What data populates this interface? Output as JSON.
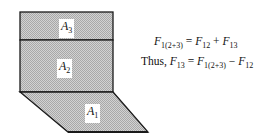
{
  "diagram": {
    "surfaces": [
      {
        "id": "A3",
        "symbol": "A",
        "subscript": "3"
      },
      {
        "id": "A2",
        "symbol": "A",
        "subscript": "2"
      },
      {
        "id": "A1",
        "symbol": "A",
        "subscript": "1"
      }
    ],
    "equations": [
      {
        "prefix": "",
        "lhs": {
          "sym": "F",
          "sub": "1(2+3)"
        },
        "op1": "=",
        "t1": {
          "sym": "F",
          "sub": "12"
        },
        "op2": "+",
        "t2": {
          "sym": "F",
          "sub": "13"
        }
      },
      {
        "prefix": "Thus,",
        "lhs": {
          "sym": "F",
          "sub": "13"
        },
        "op1": "=",
        "t1": {
          "sym": "F",
          "sub": "1(2+3)"
        },
        "op2": "−",
        "t2": {
          "sym": "F",
          "sub": "12"
        }
      }
    ],
    "colors": {
      "fill": "#c8c8c8",
      "stroke": "#1a1a1a",
      "background": "#ffffff"
    }
  }
}
